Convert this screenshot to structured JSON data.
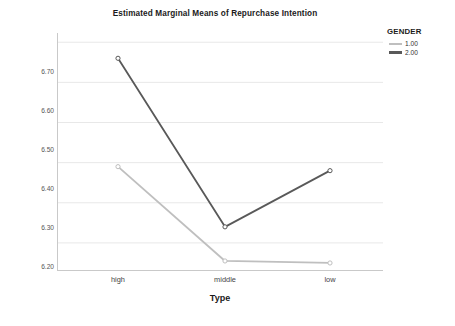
{
  "chart_data": {
    "type": "line",
    "title": "Estimated Marginal Means of Repurchase Intention",
    "xlabel": "Type",
    "ylabel": "Estimated Marginal Means",
    "categories": [
      "high",
      "middle",
      "low"
    ],
    "ytick_labels": [
      "6.70",
      "6.60",
      "6.50",
      "6.40",
      "6.30",
      "6.20"
    ],
    "ytick_values": [
      6.7,
      6.6,
      6.5,
      6.4,
      6.3,
      6.2
    ],
    "ylim": [
      6.13,
      6.723
    ],
    "grid": true,
    "legend_position": "right",
    "legend_title": "GENDER",
    "series": [
      {
        "name": "1.00",
        "color": "#bfbfbf",
        "values": [
          6.39,
          6.155,
          6.15
        ],
        "marker": "circle-open"
      },
      {
        "name": "2.00",
        "color": "#595959",
        "values": [
          6.66,
          6.24,
          6.38
        ],
        "marker": "circle-open"
      }
    ]
  },
  "colors": {
    "series_light": "#bfbfbf",
    "series_dark": "#595959",
    "gridline": "#e8e8e8",
    "axis": "#c9c9c9",
    "text": "#1b1b1b",
    "tick_text": "#555555",
    "background": "#ffffff"
  }
}
